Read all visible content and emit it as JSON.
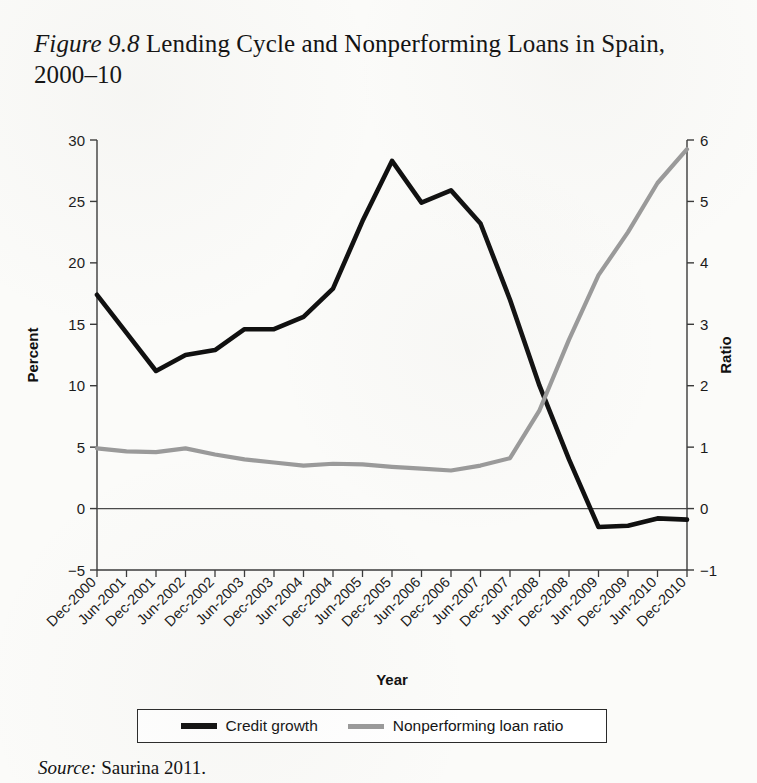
{
  "figure": {
    "label": "Figure 9.8",
    "title_rest": " Lending Cycle and Nonperforming Loans in Spain, 2000–10",
    "full_title": "Figure 9.8 Lending Cycle and Nonperforming Loans in Spain, 2000–10"
  },
  "source": {
    "label": "Source:",
    "text": " Saurina 2011."
  },
  "legend": {
    "items": [
      {
        "label": "Credit growth",
        "color": "#101010",
        "swatch": "legend-line-credit-growth"
      },
      {
        "label": "Nonperforming loan ratio",
        "color": "#9a9a9a",
        "swatch": "legend-line-npl-ratio"
      }
    ]
  },
  "chart_data": {
    "type": "line",
    "title": "Figure 9.8 Lending Cycle and Nonperforming Loans in Spain, 2000–10",
    "xlabel": "Year",
    "ylabel": "Percent",
    "y2label": "Ratio",
    "grid": false,
    "legend_position": "bottom",
    "ylim": [
      -5,
      30
    ],
    "y2lim": [
      -1,
      6
    ],
    "yticks": [
      -5,
      0,
      5,
      10,
      15,
      20,
      25,
      30
    ],
    "ytick_labels": [
      "−5",
      "0",
      "5",
      "10",
      "15",
      "20",
      "25",
      "30"
    ],
    "y2ticks": [
      -1,
      0,
      1,
      2,
      3,
      4,
      5,
      6
    ],
    "y2tick_labels": [
      "−1",
      "0",
      "1",
      "2",
      "3",
      "4",
      "5",
      "6"
    ],
    "categories": [
      "Dec-2000",
      "Jun-2001",
      "Dec-2001",
      "Jun-2002",
      "Dec-2002",
      "Jun-2003",
      "Dec-2003",
      "Jun-2004",
      "Dec-2004",
      "Jun-2005",
      "Dec-2005",
      "Jun-2006",
      "Dec-2006",
      "Jun-2007",
      "Dec-2007",
      "Jun-2008",
      "Dec-2008",
      "Jun-2009",
      "Dec-2009",
      "Jun-2010",
      "Dec-2010"
    ],
    "series": [
      {
        "name": "Credit growth",
        "axis": "left",
        "unit": "Percent",
        "color": "#101010",
        "values": [
          17.4,
          14.3,
          11.2,
          12.5,
          12.9,
          14.6,
          14.6,
          15.6,
          17.9,
          23.4,
          28.3,
          24.9,
          25.9,
          23.2,
          17.0,
          10.0,
          4.0,
          -1.5,
          -1.4,
          -0.8,
          -0.9
        ]
      },
      {
        "name": "Nonperforming loan ratio",
        "axis": "right",
        "unit": "Ratio",
        "color": "#9a9a9a",
        "values": [
          0.98,
          0.93,
          0.92,
          0.98,
          0.88,
          0.8,
          0.75,
          0.7,
          0.73,
          0.72,
          0.68,
          0.65,
          0.62,
          0.7,
          0.82,
          1.6,
          2.75,
          3.8,
          4.5,
          5.3,
          5.85
        ]
      }
    ]
  },
  "axes": {
    "x_title": "Year",
    "y_left_title": "Percent",
    "y_right_title": "Ratio"
  }
}
